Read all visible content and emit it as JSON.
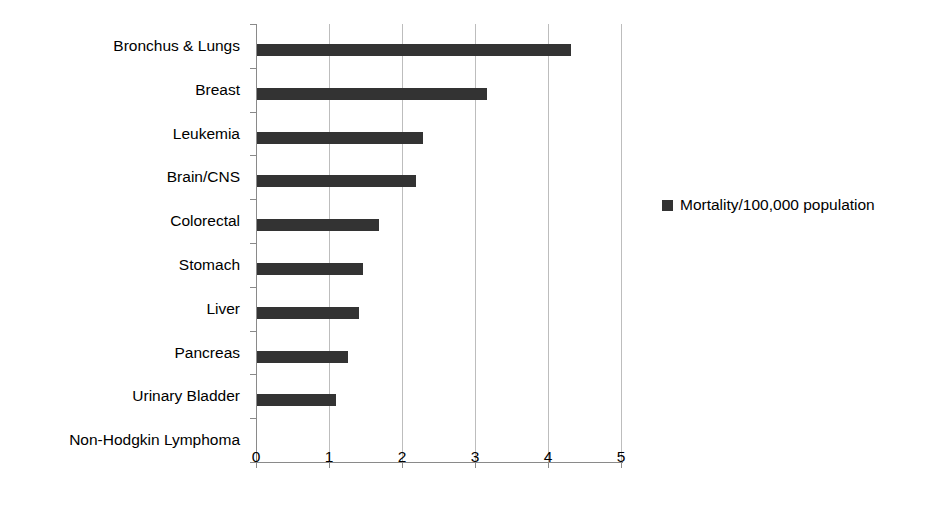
{
  "chart_data": {
    "type": "bar",
    "orientation": "horizontal",
    "title": "",
    "xlabel": "",
    "ylabel": "",
    "xlim": [
      0,
      5
    ],
    "xticks": [
      "0",
      "1",
      "2",
      "3",
      "4",
      "5"
    ],
    "grid": true,
    "legend_position": "right",
    "series": [
      {
        "name": "Mortality/100,000 population",
        "color": "#333333",
        "values": [
          4.3,
          3.15,
          2.27,
          2.18,
          1.67,
          1.45,
          1.4,
          1.25,
          1.08,
          0
        ]
      }
    ],
    "categories": [
      "Bronchus & Lungs",
      "Breast",
      "Leukemia",
      "Brain/CNS",
      "Colorectal",
      "Stomach",
      "Liver",
      "Pancreas",
      "Urinary Bladder",
      "Non-Hodgkin Lymphoma"
    ]
  },
  "legend": {
    "entries": [
      {
        "label": "Mortality/100,000 population",
        "color": "#333333"
      }
    ]
  },
  "colors": {
    "bar": "#333333",
    "axis": "#8a8a8a",
    "grid": "#bdbdbd",
    "background": "#ffffff",
    "text": "#000000"
  }
}
